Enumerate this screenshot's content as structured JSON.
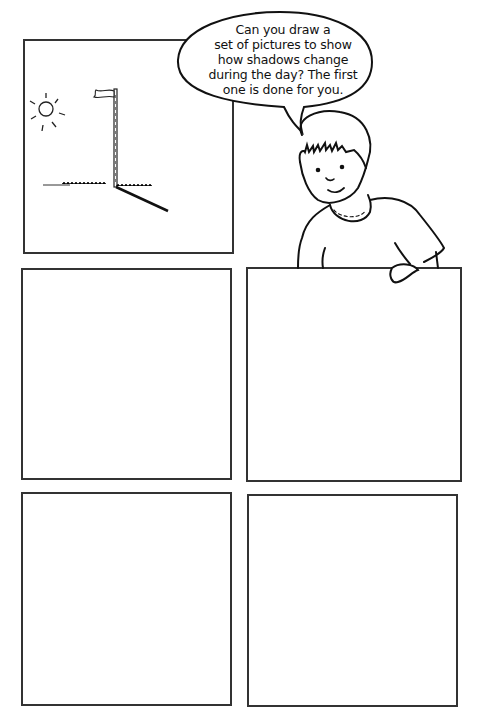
{
  "worksheet": {
    "speech_bubble": {
      "lines": [
        "Can you draw a",
        "set of pictures to show",
        "how shadows change",
        "during the day? The first",
        "one is done for you."
      ]
    },
    "panels": [
      {
        "id": "panel-1",
        "content": "example: sun, flagpole with flag, shadow on grass"
      },
      {
        "id": "panel-2",
        "content": "blank"
      },
      {
        "id": "panel-3",
        "content": "blank"
      },
      {
        "id": "panel-4",
        "content": "blank"
      },
      {
        "id": "panel-5",
        "content": "blank"
      }
    ],
    "character": "boy-illustration",
    "icons": [
      "sun-icon",
      "flagpole-icon",
      "flag-icon",
      "shadow-line",
      "grass-line"
    ],
    "colors": {
      "ink": "#222222",
      "border": "#333333",
      "background": "#ffffff"
    }
  }
}
